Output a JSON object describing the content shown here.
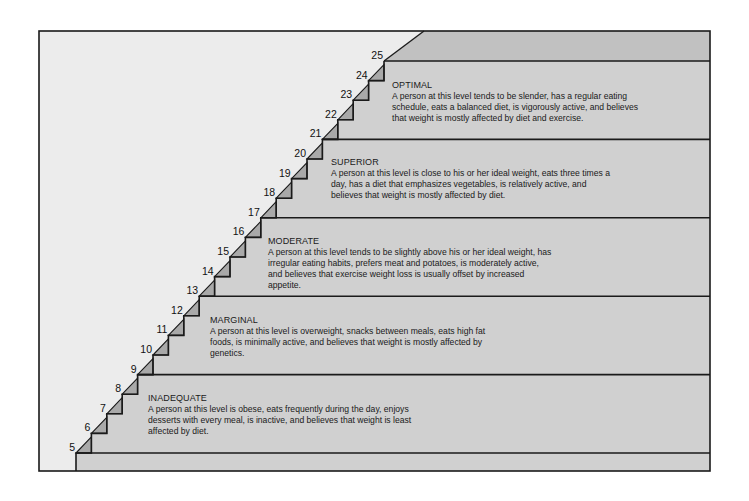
{
  "colors": {
    "background": "#ffffff",
    "wall": "#ececec",
    "step_face": "#d0d0d0",
    "top_band": "#c1c1c1",
    "nosing": "#a9a9a9",
    "line": "#1a1a1a"
  },
  "steps": [
    "5",
    "6",
    "7",
    "8",
    "9",
    "10",
    "11",
    "12",
    "13",
    "14",
    "15",
    "16",
    "17",
    "18",
    "19",
    "20",
    "21",
    "22",
    "23",
    "24",
    "25"
  ],
  "levels": [
    {
      "title": "OPTIMAL",
      "lines": [
        "A person at this level tends to be slender, has a regular eating",
        "schedule, eats a balanced diet, is vigorously active, and believes",
        "that weight is mostly affected by diet and exercise."
      ]
    },
    {
      "title": "SUPERIOR",
      "lines": [
        "A person at this level is close to his or her ideal weight, eats three times a",
        "day, has a diet that emphasizes vegetables, is relatively active, and",
        "believes that weight is mostly affected by diet."
      ]
    },
    {
      "title": "MODERATE",
      "lines": [
        "A person at this level tends to be slightly above his or her ideal weight, has",
        "irregular eating habits, prefers meat and potatoes, is moderately active,",
        "and believes that exercise weight loss is usually offset by increased",
        "appetite."
      ]
    },
    {
      "title": "MARGINAL",
      "lines": [
        "A person at this level is overweight, snacks between meals, eats high fat",
        "foods, is minimally active, and believes that weight is mostly affected by",
        "genetics."
      ]
    },
    {
      "title": "INADEQUATE",
      "lines": [
        "A person at this level is obese, eats frequently during the day, enjoys",
        "desserts with every meal, is inactive, and believes that weight is least",
        "affected by diet."
      ]
    }
  ]
}
